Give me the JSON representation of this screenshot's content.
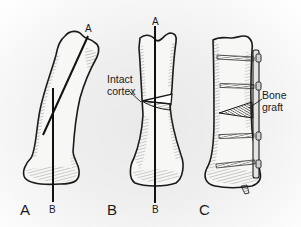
{
  "figure": {
    "background_color": "#efefef",
    "bone_fill": "#f7f7f5",
    "line_color": "#1a1a1a",
    "panels": [
      {
        "id": "A",
        "label": "A",
        "state": "curved bone with two reference axes",
        "axis_labels": {
          "top": "A",
          "bottom": "B"
        }
      },
      {
        "id": "B",
        "label": "B",
        "state": "straightened bone after oblique cut",
        "axis_labels": {
          "top": "A",
          "bottom": "B"
        },
        "callout": {
          "line1": "Intact",
          "line2": "cortex"
        }
      },
      {
        "id": "C",
        "label": "C",
        "state": "bone fixed with plate and screws, wedge graft inserted",
        "callout": {
          "line1": "Bone",
          "line2": "graft"
        }
      }
    ]
  }
}
